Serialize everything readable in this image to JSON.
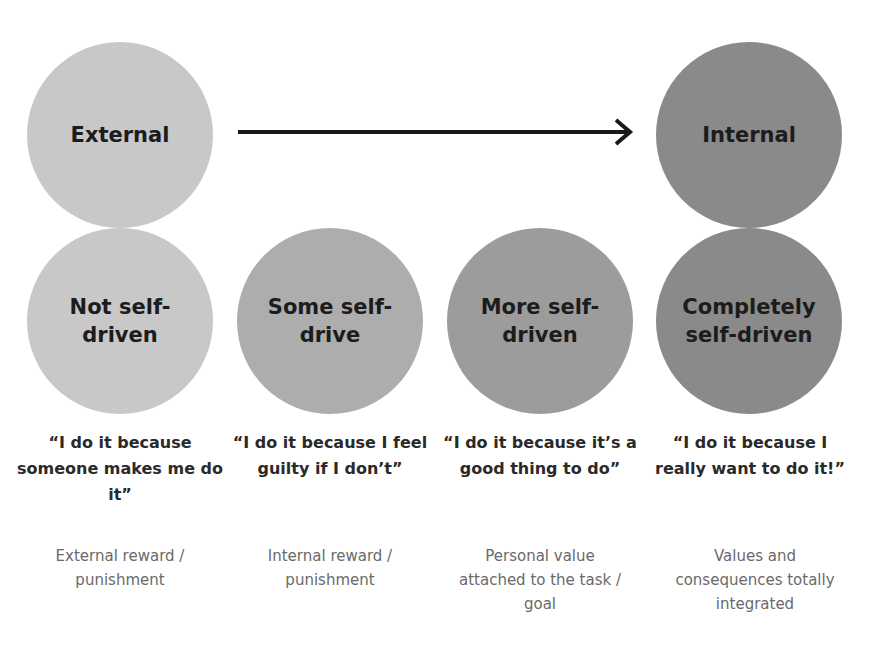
{
  "scale": {
    "start": {
      "label": "External",
      "color": "#c8c8c8"
    },
    "end": {
      "label": "Internal",
      "color": "#8a8a8a"
    }
  },
  "stages": [
    {
      "label": "Not self-driven",
      "line1": "Not self-",
      "line2": "driven",
      "color": "#c8c8c8",
      "quote": "“I do it because someone makes me do it”",
      "description": "External reward / punishment"
    },
    {
      "label": "Some self-drive",
      "line1": "Some self-",
      "line2": "drive",
      "color": "#adadad",
      "quote": "“I do it because I feel guilty if I don’t”",
      "description": "Internal reward / punishment"
    },
    {
      "label": "More self-driven",
      "line1": "More self-",
      "line2": "driven",
      "color": "#9c9c9c",
      "quote": "“I do it because it’s a good thing to do”",
      "description": "Personal value attached to the task / goal"
    },
    {
      "label": "Completely self-driven",
      "line1": "Completely",
      "line2": "self-driven",
      "color": "#8a8a8a",
      "quote": "“I do it because I really want to do it!”",
      "description": "Values and consequences totally integrated"
    }
  ],
  "icons": {
    "arrow": "right-arrow-icon"
  }
}
